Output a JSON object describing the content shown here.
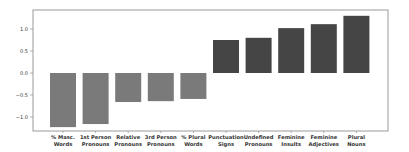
{
  "chart_data": {
    "type": "bar",
    "title": "",
    "xlabel": "",
    "ylabel": "",
    "ylim": [
      -1.3,
      1.42
    ],
    "yticks": [
      1.0,
      0.5,
      0.0,
      -0.5,
      -1.0
    ],
    "ytick_labels": [
      "1.0",
      "0.5",
      "0.0",
      "−0.5",
      "−1.0"
    ],
    "grid": false,
    "legend": null,
    "categories": [
      [
        "% Masc.",
        "Words"
      ],
      [
        "1st Person",
        "Pronouns"
      ],
      [
        "Relative",
        "Pronouns"
      ],
      [
        "3rd Person",
        "Pronouns"
      ],
      [
        "% Plural",
        "Words"
      ],
      [
        "Punctuation",
        "Signs"
      ],
      [
        "Undefined",
        "Pronouns"
      ],
      [
        "Feminine",
        "Insults"
      ],
      [
        "Feminine",
        "Adjectives"
      ],
      [
        "Plural",
        "Nouns"
      ]
    ],
    "values": [
      -1.23,
      -1.16,
      -0.66,
      -0.64,
      -0.59,
      0.75,
      0.8,
      1.02,
      1.11,
      1.3
    ],
    "colors": {
      "negative": "#7a7a7a",
      "positive": "#454545",
      "axis": "#9a9a9a",
      "text": "#333333"
    }
  }
}
